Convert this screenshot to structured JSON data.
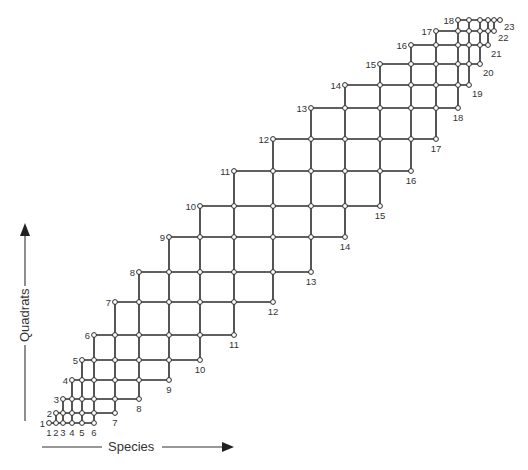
{
  "diagram": {
    "type": "staggered-grid",
    "axes": {
      "x_label": "Species",
      "y_label": "Quadrats"
    },
    "quadrat_count": 18,
    "species_count": 23,
    "band_width": 6,
    "column_x": [
      49,
      56,
      63,
      72,
      82,
      94,
      115,
      139,
      169,
      200,
      234,
      273,
      311,
      345,
      380,
      411,
      436,
      458,
      469,
      480,
      488,
      494,
      500
    ],
    "row_y": [
      423,
      413,
      399,
      380,
      360,
      335,
      302,
      272,
      237,
      206,
      171,
      139,
      108,
      85,
      64,
      45,
      31,
      20
    ],
    "row_labels": [
      "1",
      "2",
      "3",
      "4",
      "5",
      "6",
      "7",
      "8",
      "9",
      "10",
      "11",
      "12",
      "13",
      "14",
      "15",
      "16",
      "17",
      "18"
    ],
    "column_labels": [
      "1",
      "2",
      "3",
      "4",
      "5",
      "6",
      "7",
      "8",
      "9",
      "10",
      "11",
      "12",
      "13",
      "14",
      "15",
      "16",
      "17",
      "18",
      "19",
      "20",
      "21",
      "22",
      "23"
    ],
    "colors": {
      "line": "#2b2b2b",
      "node_fill": "#ffffff",
      "text": "#333333"
    }
  }
}
